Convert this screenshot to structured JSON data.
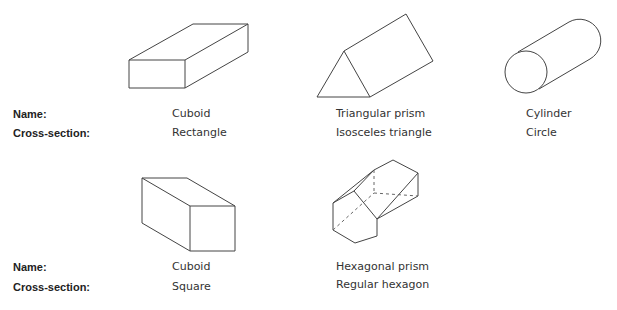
{
  "rows": [
    {
      "name_label": "Name:",
      "cross_section_label": "Cross-section:",
      "shapes": [
        {
          "name": "Cuboid",
          "cross_section": "Rectangle"
        },
        {
          "name": "Triangular prism",
          "cross_section": "Isosceles triangle"
        },
        {
          "name": "Cylinder",
          "cross_section": "Circle"
        }
      ]
    },
    {
      "name_label": "Name:",
      "cross_section_label": "Cross-section:",
      "shapes": [
        {
          "name": "Cuboid",
          "cross_section": "Square"
        },
        {
          "name": "Hexagonal prism",
          "cross_section": "Regular hexagon"
        }
      ]
    }
  ]
}
